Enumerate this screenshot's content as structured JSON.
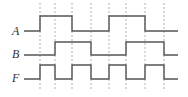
{
  "colors": {
    "background": "#ffffff",
    "waveform": "#555555",
    "gridline": "#9a9a9a",
    "label": "#333333"
  },
  "signals": [
    {
      "name": "A",
      "label": "A",
      "levels": [
        0,
        1,
        1,
        0,
        0,
        1,
        1,
        0,
        0
      ]
    },
    {
      "name": "B",
      "label": "B",
      "levels": [
        0,
        0,
        1,
        1,
        0,
        0,
        1,
        1,
        0
      ]
    },
    {
      "name": "F",
      "label": "F",
      "levels": [
        0,
        1,
        0,
        1,
        0,
        1,
        0,
        1,
        0
      ]
    }
  ],
  "time_boundaries_px": [
    24,
    40,
    55,
    72,
    91,
    109,
    126,
    145,
    164,
    178
  ],
  "dashed_lines_px": [
    40,
    55,
    72,
    91,
    109,
    126,
    145,
    164
  ],
  "relation": "F = A XOR B"
}
